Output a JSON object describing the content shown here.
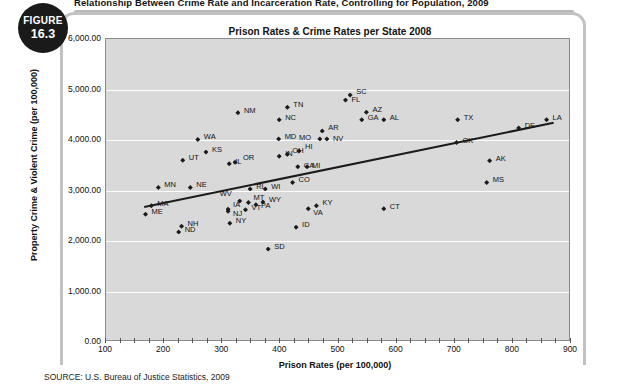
{
  "figure": {
    "badge_word": "FIGURE",
    "badge_number": "16.3",
    "header_title": "Relationship Between Crime Rate and Incarceration Rate, Controlling for Population, 2009",
    "source": "SOURCE: U.S. Bureau of Justice Statistics, 2009"
  },
  "chart_data": {
    "type": "scatter",
    "title": "Prison Rates & Crime Rates per State 2008",
    "xlabel": "Prison Rates (per 100,000)",
    "ylabel": "Property Crime & Violent Crime (per 100,000)",
    "xlim": [
      100,
      900
    ],
    "ylim": [
      0,
      6000
    ],
    "xticks": [
      "100",
      "200",
      "300",
      "400",
      "500",
      "600",
      "700",
      "800",
      "900"
    ],
    "yticks": [
      "0.00",
      "1,000.00",
      "2,000.00",
      "3,000.00",
      "4,000.00",
      "5,000.00",
      "6,000.00"
    ],
    "grid": true,
    "legend": "none",
    "point_label_key": "state postal abbreviation",
    "trendline": {
      "x0": 165,
      "y0": 2690,
      "x1": 870,
      "y1": 4360
    },
    "points": [
      {
        "label": "MA",
        "x": 178,
        "y": 2700,
        "lx": 6,
        "ly": -3
      },
      {
        "label": "ME",
        "x": 168,
        "y": 2530,
        "lx": 6,
        "ly": -3
      },
      {
        "label": "MN",
        "x": 190,
        "y": 3060,
        "lx": 6,
        "ly": -3
      },
      {
        "label": "NE",
        "x": 245,
        "y": 3060,
        "lx": 6,
        "ly": -3
      },
      {
        "label": "NH",
        "x": 230,
        "y": 2290,
        "lx": 6,
        "ly": -3
      },
      {
        "label": "ND",
        "x": 225,
        "y": 2180,
        "lx": 6,
        "ly": -3
      },
      {
        "label": "UT",
        "x": 232,
        "y": 3600,
        "lx": 6,
        "ly": -3
      },
      {
        "label": "WA",
        "x": 258,
        "y": 4010,
        "lx": 6,
        "ly": -3
      },
      {
        "label": "KS",
        "x": 272,
        "y": 3760,
        "lx": 6,
        "ly": -3
      },
      {
        "label": "NM",
        "x": 327,
        "y": 4540,
        "lx": 6,
        "ly": -3
      },
      {
        "label": "IL",
        "x": 312,
        "y": 3530,
        "lx": 6,
        "ly": -3
      },
      {
        "label": "OR",
        "x": 322,
        "y": 3560,
        "lx": 8,
        "ly": -5
      },
      {
        "label": "WV",
        "x": 330,
        "y": 2790,
        "lx": -20,
        "ly": -8
      },
      {
        "label": "IA",
        "x": 310,
        "y": 2630,
        "lx": 5,
        "ly": -5
      },
      {
        "label": "NJ",
        "x": 310,
        "y": 2590,
        "lx": 5,
        "ly": 2
      },
      {
        "label": "NY",
        "x": 313,
        "y": 2350,
        "lx": 6,
        "ly": -3
      },
      {
        "label": "MT",
        "x": 345,
        "y": 2760,
        "lx": 5,
        "ly": -6
      },
      {
        "label": "RI",
        "x": 348,
        "y": 3030,
        "lx": 6,
        "ly": -3
      },
      {
        "label": "VT",
        "x": 340,
        "y": 2620,
        "lx": 6,
        "ly": -3
      },
      {
        "label": "PA",
        "x": 358,
        "y": 2720,
        "lx": 5,
        "ly": 0
      },
      {
        "label": "WY",
        "x": 370,
        "y": 2770,
        "lx": 6,
        "ly": -3
      },
      {
        "label": "WI",
        "x": 374,
        "y": 3030,
        "lx": 6,
        "ly": -3
      },
      {
        "label": "SD",
        "x": 379,
        "y": 1840,
        "lx": 6,
        "ly": -3
      },
      {
        "label": "IN",
        "x": 398,
        "y": 3680,
        "lx": 6,
        "ly": -3
      },
      {
        "label": "MD",
        "x": 397,
        "y": 4020,
        "lx": 6,
        "ly": -3
      },
      {
        "label": "NC",
        "x": 398,
        "y": 4400,
        "lx": 6,
        "ly": -3
      },
      {
        "label": "TN",
        "x": 412,
        "y": 4650,
        "lx": 6,
        "ly": -3
      },
      {
        "label": "OH",
        "x": 412,
        "y": 3720,
        "lx": 5,
        "ly": -4
      },
      {
        "label": "HI",
        "x": 432,
        "y": 3780,
        "lx": 6,
        "ly": -5
      },
      {
        "label": "CA",
        "x": 430,
        "y": 3470,
        "lx": 6,
        "ly": -2
      },
      {
        "label": "MI",
        "x": 446,
        "y": 3470,
        "lx": 5,
        "ly": -2
      },
      {
        "label": "CO",
        "x": 421,
        "y": 3160,
        "lx": 6,
        "ly": -3
      },
      {
        "label": "ID",
        "x": 427,
        "y": 2270,
        "lx": 6,
        "ly": -3
      },
      {
        "label": "VA",
        "x": 448,
        "y": 2640,
        "lx": 5,
        "ly": 3
      },
      {
        "label": "KY",
        "x": 462,
        "y": 2700,
        "lx": 6,
        "ly": -4
      },
      {
        "label": "MO",
        "x": 468,
        "y": 4020,
        "lx": -21,
        "ly": -2
      },
      {
        "label": "NV",
        "x": 480,
        "y": 4020,
        "lx": 6,
        "ly": -1
      },
      {
        "label": "AR",
        "x": 472,
        "y": 4180,
        "lx": 6,
        "ly": -4
      },
      {
        "label": "FL",
        "x": 512,
        "y": 4790,
        "lx": 6,
        "ly": -1
      },
      {
        "label": "SC",
        "x": 520,
        "y": 4890,
        "lx": 6,
        "ly": -4
      },
      {
        "label": "GA",
        "x": 540,
        "y": 4400,
        "lx": 6,
        "ly": -3
      },
      {
        "label": "AZ",
        "x": 548,
        "y": 4550,
        "lx": 6,
        "ly": -3
      },
      {
        "label": "AL",
        "x": 578,
        "y": 4400,
        "lx": 6,
        "ly": -3
      },
      {
        "label": "CT",
        "x": 578,
        "y": 2640,
        "lx": 6,
        "ly": -3
      },
      {
        "label": "TX",
        "x": 705,
        "y": 4400,
        "lx": 6,
        "ly": -3
      },
      {
        "label": "OK",
        "x": 703,
        "y": 3950,
        "lx": 6,
        "ly": -3
      },
      {
        "label": "AK",
        "x": 760,
        "y": 3590,
        "lx": 6,
        "ly": -3
      },
      {
        "label": "MS",
        "x": 755,
        "y": 3160,
        "lx": 6,
        "ly": -3
      },
      {
        "label": "DE",
        "x": 810,
        "y": 4240,
        "lx": 6,
        "ly": -3
      },
      {
        "label": "LA",
        "x": 858,
        "y": 4400,
        "lx": 6,
        "ly": -3
      }
    ]
  }
}
